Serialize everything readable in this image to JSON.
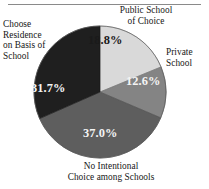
{
  "figure": {
    "name": "pie-chart-school-choice",
    "has_top_rule": true
  },
  "chart_data": {
    "type": "pie",
    "title": "",
    "subtitle": "",
    "xlabel": "",
    "ylabel": "",
    "grid": false,
    "legend_position": "outside-callout-labels",
    "units": "percent",
    "start_angle_deg": 0,
    "direction": "clockwise",
    "categories": [
      "Public School of Choice",
      "Private School",
      "No Intentional Choice among Schools",
      "Choose Residence on Basis of School"
    ],
    "values": [
      18.8,
      12.6,
      37.0,
      31.7
    ],
    "value_labels": [
      "18.8%",
      "12.6%",
      "37.0%",
      "31.7%"
    ],
    "colors": [
      "#d9d9d9",
      "#848484",
      "#5e5e5e",
      "#1f1f1f"
    ],
    "label_colors": [
      "#1a1a1a",
      "#f4f4f4",
      "#f4f4f4",
      "#f4f4f4"
    ],
    "slices": [
      {
        "label": "Public School of Choice",
        "label_lines": "Public School\nof Choice",
        "value": 18.8,
        "value_label": "18.8%",
        "color": "#d9d9d9",
        "start_deg": 0.0,
        "end_deg": 67.68
      },
      {
        "label": "Private School",
        "label_lines": "Private\nSchool",
        "value": 12.6,
        "value_label": "12.6%",
        "color": "#848484",
        "start_deg": 67.68,
        "end_deg": 113.04
      },
      {
        "label": "No Intentional Choice among Schools",
        "label_lines": "No Intentional\nChoice among Schools",
        "value": 37.0,
        "value_label": "37.0%",
        "color": "#5e5e5e",
        "start_deg": 113.04,
        "end_deg": 246.24
      },
      {
        "label": "Choose Residence on Basis of School",
        "label_lines": "Choose\nResidence\non Basis of\nSchool",
        "value": 31.7,
        "value_label": "31.7%",
        "color": "#1f1f1f",
        "start_deg": 246.24,
        "end_deg": 360.0
      }
    ]
  }
}
